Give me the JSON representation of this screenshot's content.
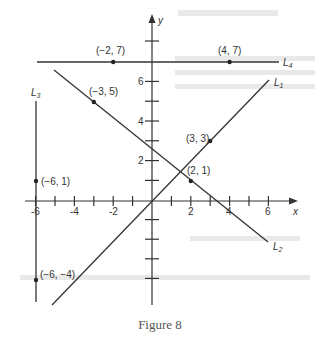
{
  "figure": {
    "caption": "Figure 8",
    "axes": {
      "x_label": "x",
      "y_label": "y",
      "x_tick_labels": [
        "-6",
        "-4",
        "-2",
        "2",
        "4",
        "6"
      ],
      "y_tick_labels": [
        "2",
        "4",
        "6"
      ]
    },
    "lines": [
      {
        "name": "L1",
        "label": "L",
        "sub": "1",
        "description": "line through origin and (3, 3)"
      },
      {
        "name": "L2",
        "label": "L",
        "sub": "2",
        "description": "line through (-3, 5) and (2, 1)"
      },
      {
        "name": "L3",
        "label": "L",
        "sub": "3",
        "description": "vertical line x = -6 through (-6, 1) and (-6, -4)"
      },
      {
        "name": "L4",
        "label": "L",
        "sub": "4",
        "description": "horizontal line y = 7 through (-2, 7) and (4, 7)"
      }
    ],
    "points": [
      {
        "label": "(−2, 7)",
        "x": -2,
        "y": 7
      },
      {
        "label": "(4, 7)",
        "x": 4,
        "y": 7
      },
      {
        "label": "(−3, 5)",
        "x": -3,
        "y": 5
      },
      {
        "label": "(3, 3)",
        "x": 3,
        "y": 3
      },
      {
        "label": "(2, 1)",
        "x": 2,
        "y": 1
      },
      {
        "label": "(−6, 1)",
        "x": -6,
        "y": 1
      },
      {
        "label": "(−6, −4)",
        "x": -6,
        "y": -4
      }
    ]
  },
  "colors": {
    "ink": "#333333",
    "caption": "#555555"
  }
}
